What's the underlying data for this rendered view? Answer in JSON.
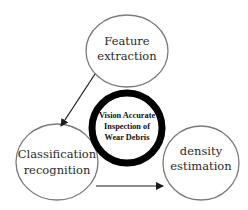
{
  "diagram": {
    "center": {
      "lines": [
        "Vision Accurate",
        "Inspection of",
        "Wear Debris"
      ],
      "ring_color": "#000000"
    },
    "nodes": [
      {
        "id": "feature-extraction",
        "lines": [
          "Feature",
          "extraction"
        ]
      },
      {
        "id": "classification-recognition",
        "lines": [
          "Classification",
          "recognition"
        ]
      },
      {
        "id": "density-estimation",
        "lines": [
          "density",
          "estimation"
        ]
      }
    ],
    "edges": [
      {
        "from": "feature-extraction",
        "to": "classification-recognition"
      },
      {
        "from": "classification-recognition",
        "to": "density-estimation"
      }
    ],
    "colors": {
      "node_stroke": "#7a7a7a",
      "arrow": "#1a1a1a",
      "background": "#ffffff"
    }
  }
}
